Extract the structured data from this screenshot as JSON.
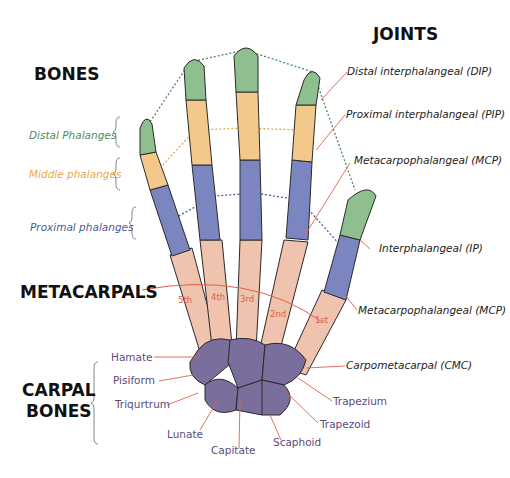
{
  "headings": {
    "bones": "BONES",
    "joints": "JOINTS",
    "metacarpals": "METACARPALS",
    "carpal_bones_line1": "CARPAL",
    "carpal_bones_line2": "BONES"
  },
  "bone_groups": [
    {
      "label": "Distal Phalanges",
      "color": "#4f8a5e"
    },
    {
      "label": "Middle phalanges",
      "color": "#e6a94e"
    },
    {
      "label": "Proximal phalanges",
      "color": "#4d5a96"
    }
  ],
  "joints": [
    {
      "label": "Distal interphalangeal (DIP)"
    },
    {
      "label": "Proximal interphalangeal (PIP)"
    },
    {
      "label": "Metacarpophalangeal (MCP)"
    },
    {
      "label": "Interphalangeal (IP)"
    },
    {
      "label": "Metacarpophalangeal (MCP)"
    },
    {
      "label": "Carpometacarpal (CMC)"
    }
  ],
  "metacarpal_numbers": [
    "5th",
    "4th",
    "3rd",
    "2nd",
    "1st"
  ],
  "carpal_bones": [
    {
      "label": "Hamate"
    },
    {
      "label": "Pisiform"
    },
    {
      "label": "Triqurtrum"
    },
    {
      "label": "Lunate"
    },
    {
      "label": "Capitate"
    },
    {
      "label": "Scaphoid"
    },
    {
      "label": "Trapezoid"
    },
    {
      "label": "Trapezium"
    }
  ],
  "colors": {
    "distal": "#8fbf8e",
    "middle": "#f2c98a",
    "proximal": "#7b86c0",
    "metacarpal": "#efc3ad",
    "carpal": "#7a6f9c",
    "leader_line": "#e0604a",
    "outline": "#2a2a2a"
  }
}
